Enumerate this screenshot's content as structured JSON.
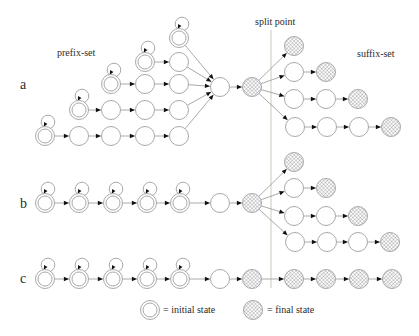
{
  "colors": {
    "background": "#ffffff",
    "node_outline": "#a9a9a9",
    "edge": "#949494",
    "arrowhead": "#111111",
    "hatch": "#6f6f6f",
    "split_line": "#d6d2c6",
    "text": "#2b2b2b"
  },
  "labels": {
    "row_a": "a",
    "row_b": "b",
    "row_c": "c",
    "prefix_set": "prefix-set",
    "split_point": "split point",
    "suffix_set": "suffix-set"
  },
  "legend": {
    "initial": "= initial state",
    "final": "= final state"
  },
  "diagram": {
    "width": 419,
    "height": 336,
    "node_radius": 9.5,
    "inner_radius": 7,
    "split_line": {
      "x": 271,
      "y1": 30,
      "y2": 288
    },
    "nodes": [
      {
        "id": "a1-1",
        "x": 179,
        "y": 38,
        "kind": "initial",
        "loop": true
      },
      {
        "id": "a2-1",
        "x": 145,
        "y": 62,
        "kind": "initial",
        "loop": true
      },
      {
        "id": "a2-2",
        "x": 179,
        "y": 62,
        "kind": "plain"
      },
      {
        "id": "a3-1",
        "x": 111,
        "y": 84,
        "kind": "initial",
        "loop": true
      },
      {
        "id": "a3-2",
        "x": 145,
        "y": 84,
        "kind": "plain"
      },
      {
        "id": "a3-3",
        "x": 179,
        "y": 84,
        "kind": "plain"
      },
      {
        "id": "a4-1",
        "x": 79,
        "y": 110,
        "kind": "initial",
        "loop": true
      },
      {
        "id": "a4-2",
        "x": 111,
        "y": 110,
        "kind": "plain"
      },
      {
        "id": "a4-3",
        "x": 145,
        "y": 110,
        "kind": "plain"
      },
      {
        "id": "a4-4",
        "x": 179,
        "y": 110,
        "kind": "plain"
      },
      {
        "id": "a5-1",
        "x": 45,
        "y": 136,
        "kind": "initial",
        "loop": true
      },
      {
        "id": "a5-2",
        "x": 79,
        "y": 136,
        "kind": "plain"
      },
      {
        "id": "a5-3",
        "x": 111,
        "y": 136,
        "kind": "plain"
      },
      {
        "id": "a5-4",
        "x": 145,
        "y": 136,
        "kind": "plain"
      },
      {
        "id": "a5-5",
        "x": 179,
        "y": 136,
        "kind": "plain"
      },
      {
        "id": "a-conv",
        "x": 220,
        "y": 87,
        "kind": "plain"
      },
      {
        "id": "a-split",
        "x": 252,
        "y": 87,
        "kind": "final"
      },
      {
        "id": "as1-f",
        "x": 294,
        "y": 46,
        "kind": "final"
      },
      {
        "id": "as2-1",
        "x": 294,
        "y": 72,
        "kind": "plain"
      },
      {
        "id": "as2-f",
        "x": 326,
        "y": 72,
        "kind": "final"
      },
      {
        "id": "as3-1",
        "x": 294,
        "y": 99,
        "kind": "plain"
      },
      {
        "id": "as3-2",
        "x": 326,
        "y": 99,
        "kind": "plain"
      },
      {
        "id": "as3-f",
        "x": 358,
        "y": 99,
        "kind": "final"
      },
      {
        "id": "as4-1",
        "x": 295,
        "y": 127,
        "kind": "plain"
      },
      {
        "id": "as4-2",
        "x": 327,
        "y": 127,
        "kind": "plain"
      },
      {
        "id": "as4-3",
        "x": 359,
        "y": 127,
        "kind": "plain"
      },
      {
        "id": "as4-f",
        "x": 391,
        "y": 127,
        "kind": "final"
      },
      {
        "id": "b-1",
        "x": 45,
        "y": 203,
        "kind": "initial",
        "loop": true
      },
      {
        "id": "b-2",
        "x": 79,
        "y": 203,
        "kind": "initial",
        "loop": true
      },
      {
        "id": "b-3",
        "x": 113,
        "y": 203,
        "kind": "initial",
        "loop": true
      },
      {
        "id": "b-4",
        "x": 147,
        "y": 203,
        "kind": "initial",
        "loop": true
      },
      {
        "id": "b-5",
        "x": 180,
        "y": 203,
        "kind": "initial",
        "loop": true
      },
      {
        "id": "b-conv",
        "x": 220,
        "y": 203,
        "kind": "plain"
      },
      {
        "id": "b-split",
        "x": 252,
        "y": 203,
        "kind": "final"
      },
      {
        "id": "bs1-f",
        "x": 294,
        "y": 162,
        "kind": "final"
      },
      {
        "id": "bs2-1",
        "x": 294,
        "y": 188,
        "kind": "plain"
      },
      {
        "id": "bs2-f",
        "x": 326,
        "y": 188,
        "kind": "final"
      },
      {
        "id": "bs3-1",
        "x": 294,
        "y": 216,
        "kind": "plain"
      },
      {
        "id": "bs3-2",
        "x": 326,
        "y": 216,
        "kind": "plain"
      },
      {
        "id": "bs3-f",
        "x": 358,
        "y": 216,
        "kind": "final"
      },
      {
        "id": "bs4-1",
        "x": 295,
        "y": 242,
        "kind": "plain"
      },
      {
        "id": "bs4-2",
        "x": 327,
        "y": 242,
        "kind": "plain"
      },
      {
        "id": "bs4-3",
        "x": 358,
        "y": 242,
        "kind": "plain"
      },
      {
        "id": "bs4-f",
        "x": 390,
        "y": 242,
        "kind": "final"
      },
      {
        "id": "c-1",
        "x": 45,
        "y": 279,
        "kind": "initial",
        "loop": true
      },
      {
        "id": "c-2",
        "x": 79,
        "y": 279,
        "kind": "initial",
        "loop": true
      },
      {
        "id": "c-3",
        "x": 113,
        "y": 279,
        "kind": "initial",
        "loop": true
      },
      {
        "id": "c-4",
        "x": 147,
        "y": 279,
        "kind": "initial",
        "loop": true
      },
      {
        "id": "c-5",
        "x": 180,
        "y": 279,
        "kind": "initial",
        "loop": true
      },
      {
        "id": "c-conv",
        "x": 220,
        "y": 279,
        "kind": "plain"
      },
      {
        "id": "c-f1",
        "x": 252,
        "y": 279,
        "kind": "final"
      },
      {
        "id": "c-f2",
        "x": 294,
        "y": 279,
        "kind": "final"
      },
      {
        "id": "c-f3",
        "x": 326,
        "y": 279,
        "kind": "final"
      },
      {
        "id": "c-f4",
        "x": 359,
        "y": 279,
        "kind": "final"
      },
      {
        "id": "c-f5",
        "x": 392,
        "y": 279,
        "kind": "final"
      },
      {
        "id": "leg-init",
        "x": 150,
        "y": 310,
        "kind": "initial"
      },
      {
        "id": "leg-final",
        "x": 253,
        "y": 310,
        "kind": "final"
      }
    ],
    "edges": [
      [
        "a2-1",
        "a2-2"
      ],
      [
        "a3-1",
        "a3-2"
      ],
      [
        "a3-2",
        "a3-3"
      ],
      [
        "a4-1",
        "a4-2"
      ],
      [
        "a4-2",
        "a4-3"
      ],
      [
        "a4-3",
        "a4-4"
      ],
      [
        "a5-1",
        "a5-2"
      ],
      [
        "a5-2",
        "a5-3"
      ],
      [
        "a5-3",
        "a5-4"
      ],
      [
        "a5-4",
        "a5-5"
      ],
      [
        "a1-1",
        "a-conv"
      ],
      [
        "a2-2",
        "a-conv"
      ],
      [
        "a3-3",
        "a-conv"
      ],
      [
        "a4-4",
        "a-conv"
      ],
      [
        "a5-5",
        "a-conv"
      ],
      [
        "a-conv",
        "a-split"
      ],
      [
        "a-split",
        "as1-f"
      ],
      [
        "a-split",
        "as2-1"
      ],
      [
        "a-split",
        "as3-1"
      ],
      [
        "a-split",
        "as4-1"
      ],
      [
        "as2-1",
        "as2-f"
      ],
      [
        "as3-1",
        "as3-2"
      ],
      [
        "as3-2",
        "as3-f"
      ],
      [
        "as4-1",
        "as4-2"
      ],
      [
        "as4-2",
        "as4-3"
      ],
      [
        "as4-3",
        "as4-f"
      ],
      [
        "b-1",
        "b-2"
      ],
      [
        "b-2",
        "b-3"
      ],
      [
        "b-3",
        "b-4"
      ],
      [
        "b-4",
        "b-5"
      ],
      [
        "b-5",
        "b-conv"
      ],
      [
        "b-conv",
        "b-split"
      ],
      [
        "b-split",
        "bs1-f"
      ],
      [
        "b-split",
        "bs2-1"
      ],
      [
        "b-split",
        "bs3-1"
      ],
      [
        "b-split",
        "bs4-1"
      ],
      [
        "bs2-1",
        "bs2-f"
      ],
      [
        "bs3-1",
        "bs3-2"
      ],
      [
        "bs3-2",
        "bs3-f"
      ],
      [
        "bs4-1",
        "bs4-2"
      ],
      [
        "bs4-2",
        "bs4-3"
      ],
      [
        "bs4-3",
        "bs4-f"
      ],
      [
        "c-1",
        "c-2"
      ],
      [
        "c-2",
        "c-3"
      ],
      [
        "c-3",
        "c-4"
      ],
      [
        "c-4",
        "c-5"
      ],
      [
        "c-5",
        "c-conv"
      ],
      [
        "c-conv",
        "c-f1"
      ],
      [
        "c-f1",
        "c-f2"
      ],
      [
        "c-f2",
        "c-f3"
      ],
      [
        "c-f3",
        "c-f4"
      ],
      [
        "c-f4",
        "c-f5"
      ]
    ]
  }
}
